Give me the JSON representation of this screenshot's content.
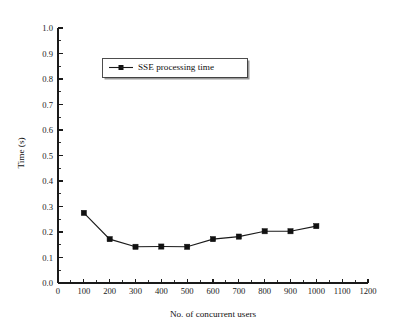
{
  "chart_data": {
    "type": "line",
    "title": "",
    "xlabel": "No. of concurrent users",
    "ylabel": "Time (s)",
    "xlim": [
      0,
      1200
    ],
    "ylim": [
      0.0,
      1.0
    ],
    "grid": false,
    "legend_position": "upper-left-inside",
    "x": [
      100,
      200,
      300,
      400,
      500,
      600,
      700,
      800,
      900,
      1000
    ],
    "xticks": [
      0,
      100,
      200,
      300,
      400,
      500,
      600,
      700,
      800,
      900,
      1000,
      1100,
      1200
    ],
    "xtick_labels": [
      "0",
      "100",
      "200",
      "300",
      "400",
      "500",
      "600",
      "700",
      "800",
      "900",
      "1000",
      "1100",
      "1200"
    ],
    "yticks": [
      0.0,
      0.1,
      0.2,
      0.3,
      0.4,
      0.5,
      0.6,
      0.7,
      0.8,
      0.9,
      1.0
    ],
    "ytick_labels": [
      "0.0",
      "0.1",
      "0.2",
      "0.3",
      "0.4",
      "0.5",
      "0.6",
      "0.7",
      "0.8",
      "0.9",
      "1.0"
    ],
    "minor_tick_interval_x": 50,
    "minor_tick_interval_y": 0.05,
    "series": [
      {
        "name": "SSE processing time",
        "marker": "square",
        "color": "#111111",
        "values": [
          0.275,
          0.172,
          0.142,
          0.143,
          0.142,
          0.172,
          0.182,
          0.203,
          0.203,
          0.223
        ]
      }
    ]
  },
  "legend": {
    "entries": [
      {
        "label": "SSE processing time"
      }
    ]
  },
  "axes": {
    "x_title": "No. of concurrent users",
    "y_title": "Time (s)"
  },
  "colors": {
    "background": "#ffffff",
    "foreground": "#111111",
    "axis": "#1a1a1a",
    "legend_shadow": "#9a9a9a"
  }
}
